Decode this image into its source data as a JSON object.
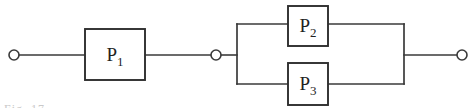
{
  "diagram": {
    "type": "reliability-block-diagram",
    "background_color": "#ffffff",
    "line_color": "#3a3a3a",
    "box_stroke_color": "#2e2e2e",
    "label_color": "#1f1f1f",
    "width": 474,
    "height": 108,
    "baseline_y": 55,
    "caption_fragment": "Fig. 17",
    "terminals": [
      {
        "name": "left-terminal",
        "cx": 14,
        "cy": 55,
        "r": 5
      },
      {
        "name": "middle-terminal",
        "cx": 216,
        "cy": 55,
        "r": 5
      },
      {
        "name": "right-terminal",
        "cx": 462,
        "cy": 55,
        "r": 5
      }
    ],
    "blocks": [
      {
        "id": "p1",
        "base": "P",
        "subscript": "1",
        "x": 85,
        "y": 29,
        "width": 60,
        "height": 51,
        "label_x": 115,
        "label_y": 61,
        "arrangement": "series"
      },
      {
        "id": "p2",
        "base": "P",
        "subscript": "2",
        "x": 288,
        "y": 6,
        "width": 40,
        "height": 40,
        "label_x": 308,
        "label_y": 32,
        "arrangement": "parallel-upper"
      },
      {
        "id": "p3",
        "base": "P",
        "subscript": "3",
        "x": 288,
        "y": 63,
        "width": 40,
        "height": 42,
        "label_x": 308,
        "label_y": 90,
        "arrangement": "parallel-lower"
      }
    ],
    "parallel_group": {
      "left_bar_x": 237,
      "right_bar_x": 404,
      "top_rail_y": 24,
      "bottom_rail_y": 84
    },
    "wires": [
      {
        "name": "wire-left-terminal-to-p1",
        "d": "M 14 55 L 85 55"
      },
      {
        "name": "wire-p1-to-middle-terminal",
        "d": "M 145 55 L 216 55"
      },
      {
        "name": "wire-middle-terminal-to-parallel",
        "d": "M 216 55 L 237 55"
      },
      {
        "name": "wire-parallel-to-right-terminal",
        "d": "M 404 55 L 462 55"
      },
      {
        "name": "rail-left-vertical",
        "d": "M 237 24 L 237 84"
      },
      {
        "name": "rail-right-vertical",
        "d": "M 404 24 L 404 84"
      },
      {
        "name": "rail-top-left-stub",
        "d": "M 237 24 L 288 24"
      },
      {
        "name": "rail-top-right-stub",
        "d": "M 328 24 L 404 24"
      },
      {
        "name": "rail-bottom-left-stub",
        "d": "M 237 84 L 288 84"
      },
      {
        "name": "rail-bottom-right-stub",
        "d": "M 328 84 L 404 84"
      }
    ]
  }
}
